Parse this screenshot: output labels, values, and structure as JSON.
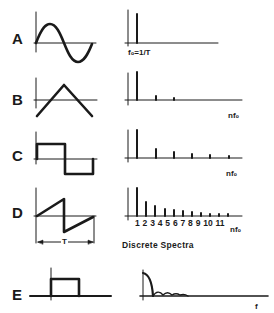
{
  "rows": [
    {
      "label": "A",
      "waveform": "sine",
      "spectrum_label": "fo=1/T",
      "harmonics": [
        1
      ]
    },
    {
      "label": "B",
      "waveform": "triangle",
      "spectrum_label": "nfo",
      "harmonics": [
        1,
        3,
        5
      ]
    },
    {
      "label": "C",
      "waveform": "square",
      "spectrum_label": "nfo",
      "harmonics": [
        1,
        3,
        5,
        7,
        9,
        11
      ]
    },
    {
      "label": "D",
      "waveform": "sawtooth",
      "spectrum_label": "nfo",
      "harmonics": [
        1,
        2,
        3,
        4,
        5,
        6,
        7,
        8,
        9,
        10,
        11
      ]
    },
    {
      "label": "E",
      "waveform": "single-pulse",
      "spectrum_label": "f",
      "harmonics": []
    }
  ],
  "labels": {
    "A": "A",
    "B": "B",
    "C": "C",
    "D": "D",
    "E": "E",
    "fo_eq": "f₀=1/T",
    "nfo_b": "nf₀",
    "nfo_c": "nf₀",
    "nfo_d": "nf₀",
    "f_e": "f",
    "period": "T",
    "harmonic_ticks": "1 2 3 4 5 6 7 8 9 10 11",
    "caption": "Discrete Spectra"
  },
  "colors": {
    "ink": "#1a1a1a",
    "background": "#ffffff"
  }
}
